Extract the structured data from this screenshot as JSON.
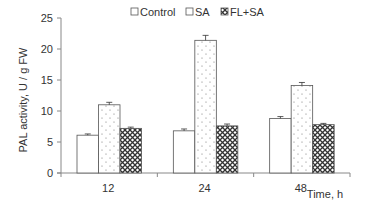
{
  "chart_data": {
    "type": "bar",
    "title": "",
    "xlabel": "Time, h",
    "ylabel": "PAL activity, U / g FW",
    "categories": [
      "12",
      "24",
      "48"
    ],
    "series": [
      {
        "name": "Control",
        "values": [
          6.1,
          6.8,
          8.8
        ],
        "errors": [
          0.2,
          0.3,
          0.3
        ],
        "fill": "white"
      },
      {
        "name": "SA",
        "values": [
          11.0,
          21.4,
          14.1
        ],
        "errors": [
          0.4,
          0.8,
          0.5
        ],
        "fill": "dots"
      },
      {
        "name": "FL+SA",
        "values": [
          7.2,
          7.6,
          7.8
        ],
        "errors": [
          0.2,
          0.3,
          0.2
        ],
        "fill": "crosshatch"
      }
    ],
    "ylim": [
      0,
      25
    ],
    "yticks": [
      "0",
      "5",
      "10",
      "15",
      "20",
      "25"
    ],
    "grid": false,
    "legend_position": "top"
  },
  "legend": {
    "items": [
      {
        "label": "Control"
      },
      {
        "label": "SA"
      },
      {
        "label": "FL+SA"
      }
    ]
  },
  "colors": {
    "axis": "#888888",
    "bar_stroke": "#555555",
    "hatch": "#333333"
  }
}
